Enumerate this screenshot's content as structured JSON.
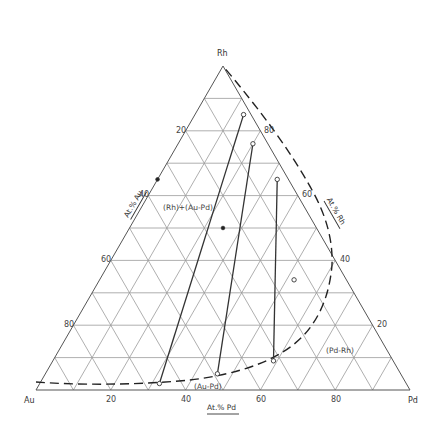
{
  "diagram": {
    "type": "ternary-phase-diagram",
    "vertices": {
      "top": "Rh",
      "left": "Au",
      "right": "Pd"
    },
    "axes": {
      "au": {
        "label": "At.% Au",
        "ticks": [
          "20",
          "40",
          "60",
          "80"
        ]
      },
      "rh": {
        "label": "At.% Rh",
        "ticks": [
          "80",
          "60",
          "40",
          "20"
        ]
      },
      "pd": {
        "label": "At.% Pd",
        "ticks": [
          "20",
          "40",
          "60",
          "80"
        ]
      }
    },
    "grid_step_percent": 10,
    "regions": {
      "two_phase": "(Rh)+(Au-Pd)",
      "au_pd": "(Au-Pd)",
      "pd_rh": "(Pd-Rh)"
    },
    "tie_lines": [
      {
        "id": 1,
        "rh_end": {
          "Au": 2,
          "Pd": 13,
          "Rh": 85
        },
        "aupd_end": {
          "Au": 66,
          "Pd": 32,
          "Rh": 2
        }
      },
      {
        "id": 2,
        "rh_end": {
          "Au": 4,
          "Pd": 20,
          "Rh": 76
        },
        "aupd_end": {
          "Au": 49,
          "Pd": 46,
          "Rh": 5
        }
      },
      {
        "id": 3,
        "rh_end": {
          "Au": 3,
          "Pd": 32,
          "Rh": 65
        },
        "aupd_end": {
          "Au": 32,
          "Pd": 59,
          "Rh": 9
        }
      }
    ],
    "points": [
      {
        "marker": "filled",
        "Au": 35,
        "Pd": 0,
        "Rh": 65
      },
      {
        "marker": "filled",
        "Au": 25,
        "Pd": 25,
        "Rh": 50
      },
      {
        "marker": "open",
        "Au": 14,
        "Pd": 52,
        "Rh": 34
      }
    ]
  }
}
